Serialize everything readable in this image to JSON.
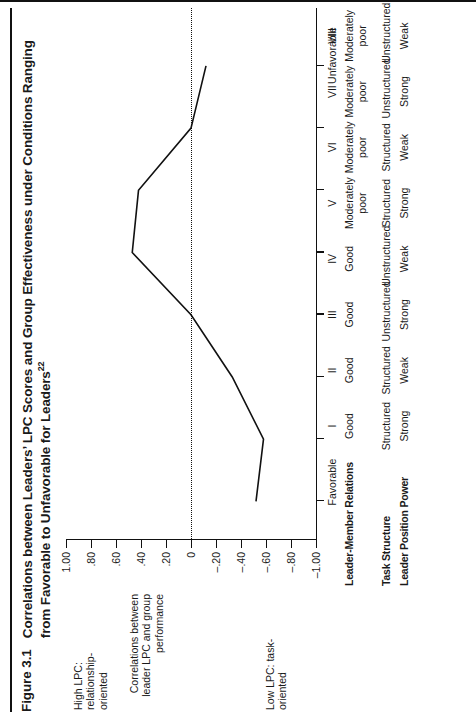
{
  "figure": {
    "number": "Figure 3.1",
    "title": "Correlations between Leaders’ LPC Scores and Group Effectiveness under Conditions Ranging from Favorable to Unfavorable for Leaders",
    "title_superscript": "22"
  },
  "axes": {
    "y_caption_high": "High LPC: relationship-oriented",
    "y_caption_high_lines": [
      "High LPC:",
      "relationship-",
      "oriented"
    ],
    "y_caption_low": "Low LPC: task-oriented",
    "y_caption_low_lines": [
      "Low LPC:",
      "task-",
      "oriented"
    ],
    "y_axis_title_line1": "Correlations between",
    "y_axis_title_line2": "leader LPC and group performance",
    "y_ticks": [
      "1.00",
      ".80",
      ".60",
      ".40",
      ".20",
      "0",
      "–.20",
      "–.40",
      "–.60",
      "–.80",
      "–1.00"
    ],
    "y_min": -1.0,
    "y_max": 1.0,
    "x_favorable_label": "Favorable",
    "x_unfavorable_label": "Unfavorable"
  },
  "condition_table": {
    "row_labels": [
      "Leader-Member Relations",
      "Task Structure",
      "Leader Position Power"
    ],
    "columns": [
      "I",
      "II",
      "III",
      "IV",
      "V",
      "VI",
      "VII",
      "VIII"
    ],
    "rows": [
      [
        "Good",
        "Good",
        "Good",
        "Good",
        "Moderately poor",
        "Moderately poor",
        "Moderately poor",
        "Moderately poor"
      ],
      [
        "Structured",
        "Structured",
        "Unstructured",
        "Unstructured",
        "Structured",
        "Structured",
        "Unstructured",
        "Unstructured"
      ],
      [
        "Strong",
        "Weak",
        "Strong",
        "Weak",
        "Strong",
        "Weak",
        "Strong",
        "Weak"
      ]
    ]
  },
  "chart_data": {
    "type": "line",
    "title": "Correlations between Leaders’ LPC Scores and Group Effectiveness under Conditions Ranging from Favorable to Unfavorable for Leaders",
    "xlabel": "",
    "ylabel": "Correlations between leader LPC and group performance",
    "categories": [
      "I",
      "II",
      "III",
      "IV",
      "V",
      "VI",
      "VII",
      "VIII"
    ],
    "values": [
      -0.52,
      -0.58,
      -0.33,
      0.0,
      0.47,
      0.42,
      0.0,
      -0.12
    ],
    "ylim": [
      -1.0,
      1.0
    ],
    "yticks": [
      1.0,
      0.8,
      0.6,
      0.4,
      0.2,
      0.0,
      -0.2,
      -0.4,
      -0.6,
      -0.8,
      -1.0
    ],
    "grid": false,
    "legend": "none",
    "zero_reference_line": true,
    "annotations": [
      "Favorable",
      "Unfavorable"
    ],
    "series": [
      {
        "name": "Correlation between leader LPC and group performance",
        "values": [
          -0.52,
          -0.58,
          -0.33,
          0.0,
          0.47,
          0.42,
          0.0,
          -0.12
        ]
      }
    ]
  },
  "colors": {
    "line": "#111111",
    "axis": "#111111",
    "background": "#ffffff",
    "text": "#1a1a1a"
  }
}
